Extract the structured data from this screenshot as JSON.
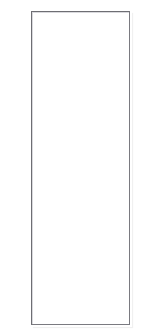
{
  "page": {
    "background_color": "#ffffff",
    "width": 151,
    "height": 336
  },
  "panel": {
    "name": "blank-panel",
    "content_text": "",
    "border_color": "#6e6e73",
    "fill_color": "#ffffff",
    "shadow_color": "#d9d9dd",
    "x": 31,
    "y": 11,
    "width": 99,
    "height": 314
  }
}
